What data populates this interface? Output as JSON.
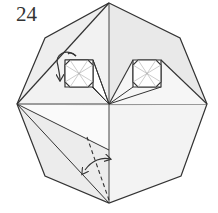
{
  "step": {
    "number": "24"
  },
  "diagram": {
    "colors": {
      "stroke": "#333333",
      "paper_shaded": "#e6e6e6",
      "paper_light": "#f4f4f4",
      "paper_white": "#ffffff"
    },
    "elements": [
      {
        "type": "octagon-outline",
        "name": "model-outline"
      },
      {
        "type": "square",
        "name": "left-square-flap"
      },
      {
        "type": "square",
        "name": "right-square-flap"
      },
      {
        "type": "curved-arrow",
        "name": "fold-behind-arrow"
      },
      {
        "type": "dashed-line",
        "name": "valley-fold-line"
      },
      {
        "type": "double-arrow",
        "name": "fold-unfold-arrow"
      }
    ]
  }
}
